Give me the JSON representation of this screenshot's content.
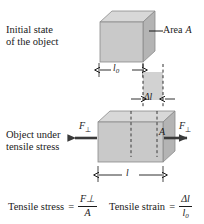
{
  "figure": {
    "type": "physics-diagram",
    "background_color": "#ffffff",
    "ink_color": "#1a1a1a",
    "face_colors": {
      "front": "#c9c9c9",
      "top": "#d8d8d8",
      "side": "#b4b4b4",
      "extension_strip": "#d2d2d2"
    }
  },
  "labels": {
    "initial_state_line1": "Initial state",
    "initial_state_line2": "of the object",
    "stressed_state_line1": "Object under",
    "stressed_state_line2": "tensile stress",
    "area_label_text": "Area",
    "area_label_symbol": "A",
    "area_inner_symbol": "A",
    "initial_length_symbol": "l",
    "initial_length_subscript": "0",
    "final_length_symbol": "l",
    "extension_symbol": "Δl",
    "force_left": "F",
    "force_right": "F",
    "force_subscript": "⊥"
  },
  "formulas": [
    {
      "name": "tensile-stress",
      "lhs": "Tensile stress",
      "equals": "=",
      "numerator": "F⊥",
      "denominator": "A"
    },
    {
      "name": "tensile-strain",
      "lhs": "Tensile strain",
      "equals": "=",
      "numerator": "Δl",
      "denominator": "l0"
    }
  ],
  "geometry": {
    "upper_cube": {
      "front_x": 100,
      "front_y": 22,
      "front_w": 43,
      "front_h": 40,
      "depth": 12
    },
    "lower_box": {
      "front_x": 98,
      "front_y": 122,
      "front_w": 53,
      "front_h": 40,
      "depth": 12
    },
    "extension_strip": {
      "x": 143,
      "y": 72,
      "w": 20,
      "h": 28
    },
    "dim_l0": {
      "x1": 99,
      "x2": 143,
      "y": 70
    },
    "dim_l": {
      "x1": 98,
      "x2": 163,
      "y": 175
    },
    "dim_dl": {
      "x1": 143,
      "x2": 163,
      "y": 99
    }
  }
}
